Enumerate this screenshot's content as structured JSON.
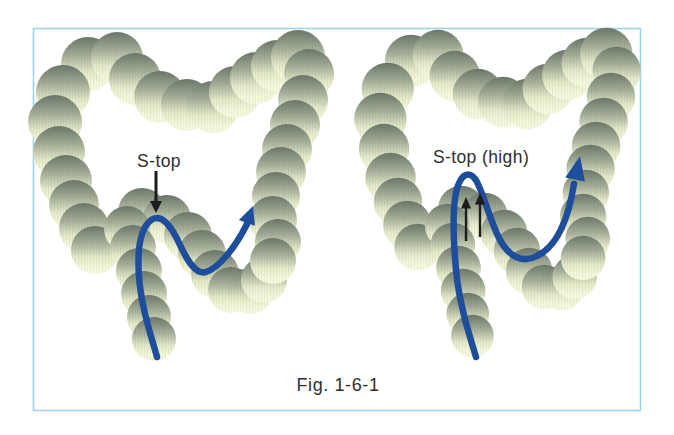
{
  "figure": {
    "caption": "Fig. 1-6-1",
    "panels": [
      {
        "label": "S-top",
        "pointer_icon": "down-arrow"
      },
      {
        "label": "S-top (high)",
        "pointer_icon": "double-up-arrow"
      }
    ],
    "colors": {
      "scope_path": "#1e4d9b",
      "annotation": "#1c1c1c",
      "frame_border": "#9fd3e6",
      "ball_shade_top": "#6b766a",
      "ball_cream": "#f5f7da",
      "label_text": "#2e2e2e",
      "background": "#ffffff"
    }
  }
}
